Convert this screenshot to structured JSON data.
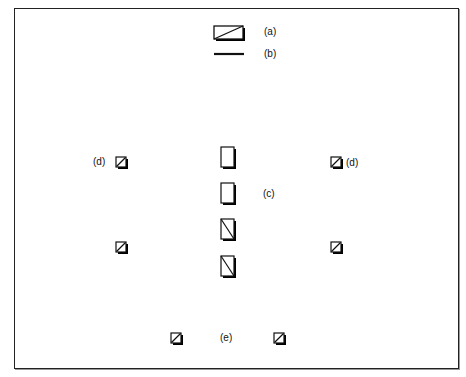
{
  "figure": {
    "labels": {
      "a": "(a)",
      "b": "(b)",
      "c": "(c)",
      "d_left": "(d)",
      "d_right": "(d)",
      "e": "(e)"
    },
    "legend": [
      {
        "key": "a",
        "shape": "rectangle-with-diagonal"
      },
      {
        "key": "b",
        "shape": "line"
      }
    ],
    "groups": {
      "c": {
        "count": 4,
        "shape": "tall-rectangle",
        "diagonal_on": [
          3,
          4
        ]
      },
      "d": {
        "count": 4,
        "shape": "small-square-with-diagonal"
      },
      "e": {
        "count": 2,
        "shape": "small-square-with-diagonal"
      }
    },
    "colors": {
      "stroke": "#111111",
      "shadow": "#000000",
      "background": "#ffffff"
    }
  }
}
